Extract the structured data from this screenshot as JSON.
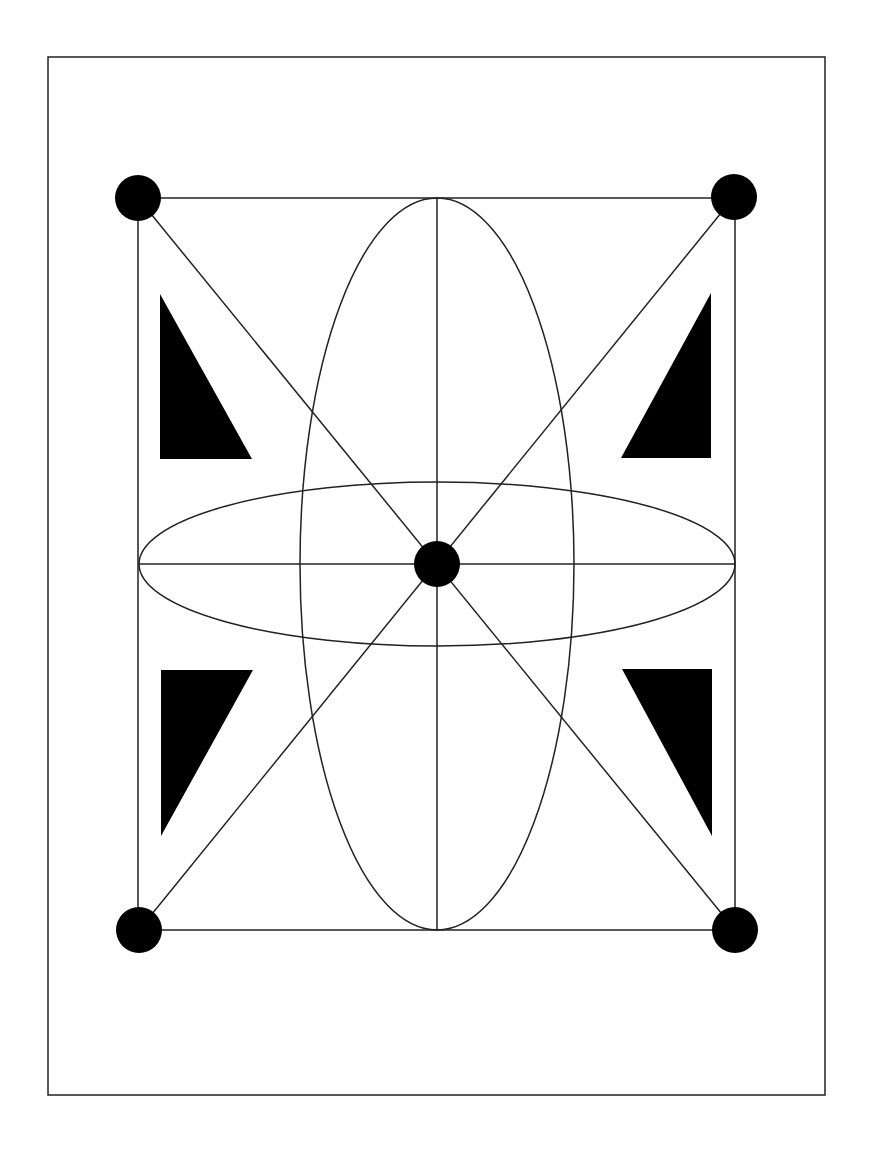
{
  "diagram": {
    "description": "Geometric figure: rectangle with corner dots, diagonals, crossed ellipses, four filled right triangles",
    "colors": {
      "background": "#ffffff",
      "stroke": "#222222",
      "fill": "#000000"
    },
    "frame": {
      "x": 48,
      "y": 57,
      "w": 777,
      "h": 1038
    },
    "inner_rect": {
      "x1": 138,
      "y1": 198,
      "x2": 735,
      "y2": 930
    },
    "center": {
      "x": 437,
      "y": 564
    },
    "dot_radius": 23,
    "dots": [
      {
        "name": "top-left",
        "cx": 138,
        "cy": 198
      },
      {
        "name": "top-right",
        "cx": 734,
        "cy": 197
      },
      {
        "name": "bottom-left",
        "cx": 139,
        "cy": 930
      },
      {
        "name": "bottom-right",
        "cx": 735,
        "cy": 930
      },
      {
        "name": "center",
        "cx": 437,
        "cy": 564
      }
    ],
    "ellipses": [
      {
        "name": "vertical-ellipse",
        "cx": 437,
        "cy": 564,
        "rx": 137,
        "ry": 366
      },
      {
        "name": "horizontal-ellipse",
        "cx": 437,
        "cy": 564,
        "rx": 298,
        "ry": 82
      }
    ],
    "lines": [
      {
        "name": "diagonal-tl-br",
        "x1": 138,
        "y1": 198,
        "x2": 735,
        "y2": 930
      },
      {
        "name": "diagonal-tr-bl",
        "x1": 734,
        "y1": 197,
        "x2": 139,
        "y2": 930
      },
      {
        "name": "vertical-axis",
        "x1": 437,
        "y1": 198,
        "x2": 437,
        "y2": 930
      },
      {
        "name": "horizontal-axis",
        "x1": 138,
        "y1": 564,
        "x2": 735,
        "y2": 564
      }
    ],
    "triangles": [
      {
        "name": "triangle-top-left",
        "points": "160,294 160,459 252,459"
      },
      {
        "name": "triangle-top-right",
        "points": "711,293 711,458 621,458"
      },
      {
        "name": "triangle-bottom-left",
        "points": "161,670 253,670 161,836"
      },
      {
        "name": "triangle-bottom-right",
        "points": "622,669 712,669 712,836"
      }
    ]
  }
}
